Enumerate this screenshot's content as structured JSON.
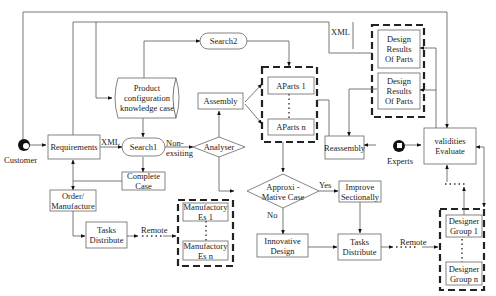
{
  "nodes": {
    "customer": "Customer",
    "requirements": "Requirements",
    "search1": "Search1",
    "search2": "Search2",
    "knowledge_case": "Product\nconfiguration\nknowledge case",
    "assembly": "Assembly",
    "aparts_1": "AParts 1",
    "aparts_n": "AParts n",
    "analyser": "Analyser",
    "complete_case": "Complete\nCase",
    "order_manufacture": "Order/\nManufacture",
    "tasks_distribute_left": "Tasks\nDistribute",
    "manufactory_1": "Manufactory\nEs 1",
    "manufactory_n": "Manufactory\nEs n",
    "approximative_case": "Approxi -\nMative Case",
    "improve_sectionally": "Improve\nSectionally",
    "innovative_design": "Innovative\nDesign",
    "tasks_distribute_right": "Tasks\nDistribute",
    "design_results_1": "Design\nResults\nOf Parts",
    "design_results_2": "Design\nResults\nOf Parts",
    "reassembly": "Reassembly",
    "experts": "Experts",
    "validities_evaluate": "validities\nEvaluate",
    "designer_group_1": "Designer\nGroup 1",
    "designer_group_n": "Designer\nGroup n"
  },
  "edge_labels": {
    "xml_left": "XML",
    "xml_top": "XML",
    "non_existing": "Non-\nexsiting",
    "yes": "Yes",
    "no": "No",
    "remote_left": "Remote",
    "remote_right": "Remote"
  },
  "icons": {
    "customer": "person-head-icon",
    "experts": "person-head-icon"
  }
}
